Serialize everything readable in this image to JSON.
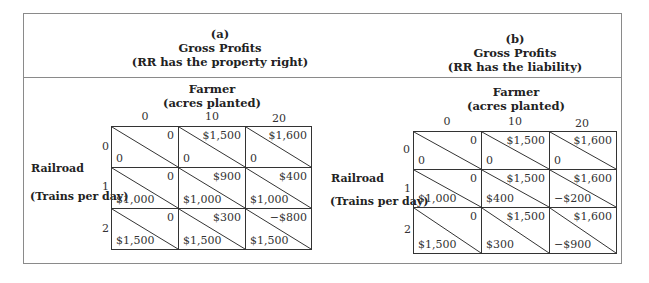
{
  "panels": [
    {
      "id": "a",
      "label": "(a)",
      "title": "Gross Profits",
      "subtitle": "(RR has the property right)",
      "column_player": "Farmer",
      "column_player_sub": "(acres planted)",
      "column_values": [
        "0",
        "10",
        "20"
      ],
      "row_player": "Railroad",
      "row_player_sub": "(Trains per day)",
      "row_values": [
        "0",
        "1",
        "2"
      ],
      "cells": [
        [
          {
            "farmer": "0",
            "railroad": "0"
          },
          {
            "farmer": "$1,500",
            "railroad": "0"
          },
          {
            "farmer": "$1,600",
            "railroad": "0"
          }
        ],
        [
          {
            "farmer": "0",
            "railroad": "$1,000"
          },
          {
            "farmer": "$900",
            "railroad": "$1,000"
          },
          {
            "farmer": "$400",
            "railroad": "$1,000"
          }
        ],
        [
          {
            "farmer": "0",
            "railroad": "$1,500"
          },
          {
            "farmer": "$300",
            "railroad": "$1,500"
          },
          {
            "farmer": "−$800",
            "railroad": "$1,500"
          }
        ]
      ]
    },
    {
      "id": "b",
      "label": "(b)",
      "title": "Gross Profits",
      "subtitle": "(RR has the liability)",
      "column_player": "Farmer",
      "column_player_sub": "(acres planted)",
      "column_values": [
        "0",
        "10",
        "20"
      ],
      "row_player": "Railroad",
      "row_player_sub": "(Trains per day)",
      "row_values": [
        "0",
        "1",
        "2"
      ],
      "cells": [
        [
          {
            "farmer": "0",
            "railroad": "0"
          },
          {
            "farmer": "$1,500",
            "railroad": "0"
          },
          {
            "farmer": "$1,600",
            "railroad": "0"
          }
        ],
        [
          {
            "farmer": "0",
            "railroad": "$1,000"
          },
          {
            "farmer": "$1,500",
            "railroad": "$400"
          },
          {
            "farmer": "$1,600",
            "railroad": "−$200"
          }
        ],
        [
          {
            "farmer": "0",
            "railroad": "$1,500"
          },
          {
            "farmer": "$1,500",
            "railroad": "$300"
          },
          {
            "farmer": "$1,600",
            "railroad": "−$900"
          }
        ]
      ]
    }
  ]
}
